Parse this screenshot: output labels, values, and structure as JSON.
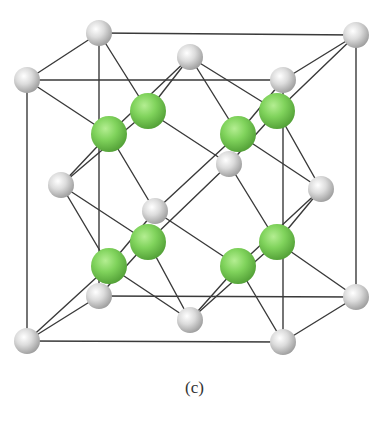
{
  "caption": "(c)",
  "colors": {
    "background": "#ffffff",
    "bond": "#3a3a3a",
    "cation": "#d8d8d8",
    "anion": "#7fd35a"
  },
  "structure": {
    "description": "Fluorite-type (CaF2) unit cell: face-centred cubic gray cations with green anions occupying all tetrahedral sites",
    "gray_atoms": [
      {
        "name": "back-top-left",
        "x": 99,
        "y": 33
      },
      {
        "name": "back-top-right",
        "x": 356,
        "y": 35
      },
      {
        "name": "front-top-left",
        "x": 27,
        "y": 80
      },
      {
        "name": "front-top-right",
        "x": 283,
        "y": 80
      },
      {
        "name": "top-face-center",
        "x": 190,
        "y": 57
      },
      {
        "name": "back-bottom-left",
        "x": 99,
        "y": 296
      },
      {
        "name": "back-bottom-right",
        "x": 356,
        "y": 297
      },
      {
        "name": "front-bottom-left",
        "x": 27,
        "y": 341
      },
      {
        "name": "front-bottom-right",
        "x": 283,
        "y": 342
      },
      {
        "name": "bottom-face-center",
        "x": 190,
        "y": 320
      },
      {
        "name": "left-face-center",
        "x": 61,
        "y": 185
      },
      {
        "name": "right-face-center",
        "x": 321,
        "y": 189
      },
      {
        "name": "front-face-center",
        "x": 155,
        "y": 211
      },
      {
        "name": "back-face-center",
        "x": 229,
        "y": 164
      }
    ],
    "green_atoms": [
      {
        "name": "tet-upper-front-left",
        "x": 109,
        "y": 134
      },
      {
        "name": "tet-upper-back-left",
        "x": 148,
        "y": 111
      },
      {
        "name": "tet-upper-front-right",
        "x": 238,
        "y": 134
      },
      {
        "name": "tet-upper-back-right",
        "x": 277,
        "y": 111
      },
      {
        "name": "tet-lower-front-left",
        "x": 109,
        "y": 266
      },
      {
        "name": "tet-lower-back-left",
        "x": 148,
        "y": 242
      },
      {
        "name": "tet-lower-front-right",
        "x": 238,
        "y": 266
      },
      {
        "name": "tet-lower-back-right",
        "x": 277,
        "y": 242
      }
    ]
  }
}
